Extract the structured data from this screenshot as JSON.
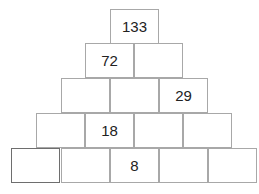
{
  "diagram": {
    "type": "number-pyramid",
    "rows": [
      [
        "133"
      ],
      [
        "72",
        ""
      ],
      [
        "",
        "",
        "29"
      ],
      [
        "",
        "18",
        "",
        ""
      ],
      [
        "",
        "",
        "8",
        "",
        ""
      ]
    ]
  }
}
